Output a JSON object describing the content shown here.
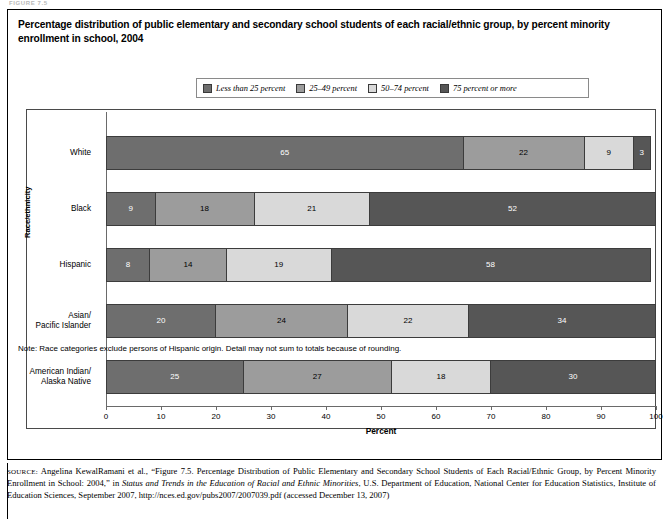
{
  "figure": {
    "crumb": "FIGURE 7.5",
    "title": "Percentage distribution of public elementary and secondary school students of each racial/ethnic group, by percent minority enrollment in school, 2004",
    "note": "Note: Race categories exclude persons of Hispanic origin. Detail may not sum to totals because of rounding.",
    "source_tag": "SOURCE:",
    "source_text_1": "Angelina KewalRamani et al., “Figure 7.5. Percentage Distribution of Public Elementary and Secondary School Students of Each Racial/Ethnic Group, by Percent Minority Enrollment in School: 2004,” in ",
    "source_italic_1": "Status and Trends in the Education of Racial and Ethnic Minorities",
    "source_text_2": ", U.S. Department of Education, National Center for Education Statistics, Institute of Education Sciences, September 2007, http://nces.ed.gov/pubs2007/2007039.pdf (accessed December 13, 2007)"
  },
  "chart_data": {
    "type": "bar",
    "orientation": "horizontal",
    "stacked": true,
    "title": "Percentage distribution of public elementary and secondary school students of each racial/ethnic group, by percent minority enrollment in school, 2004",
    "xlabel": "Percent",
    "ylabel": "Race/ethnicity",
    "xlim": [
      0,
      100
    ],
    "xticks": [
      0,
      10,
      20,
      30,
      40,
      50,
      60,
      70,
      80,
      90,
      100
    ],
    "xtick_labels": [
      "0",
      "10",
      "20",
      "30",
      "40",
      "50",
      "60",
      "70",
      "80",
      "90",
      "100"
    ],
    "grid": false,
    "legend_position": "top-center",
    "categories": [
      "White",
      "Black",
      "Hispanic",
      "Asian/\nPacific Islander",
      "American Indian/\nAlaska Native"
    ],
    "series": [
      {
        "name": "Less than 25 percent",
        "color": "#6e6e6e",
        "label_color": "#ffffff",
        "values": [
          65,
          9,
          8,
          20,
          25
        ]
      },
      {
        "name": "25–49 percent",
        "color": "#9c9c9c",
        "label_color": "#000000",
        "values": [
          22,
          18,
          14,
          24,
          27
        ]
      },
      {
        "name": "50–74 percent",
        "color": "#d9d9d9",
        "label_color": "#000000",
        "values": [
          9,
          21,
          19,
          22,
          18
        ]
      },
      {
        "name": "75 percent or more",
        "color": "#565656",
        "label_color": "#ffffff",
        "values": [
          3,
          52,
          58,
          34,
          30
        ]
      }
    ]
  }
}
